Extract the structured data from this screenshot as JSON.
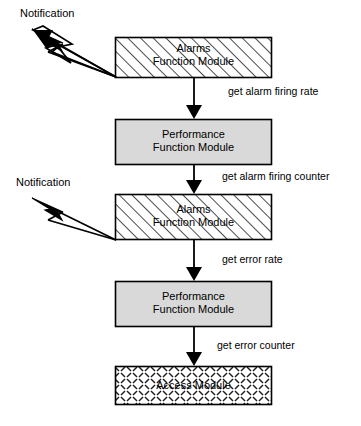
{
  "diagram": {
    "type": "flow-diagram",
    "background_color": "#ffffff",
    "stroke_color": "#000000",
    "fill_gray": "#d9d9d9",
    "nodes": [
      {
        "id": "alarms-1",
        "line1": "Alarms",
        "line2": "Function Module",
        "fill": "diagonal-hatch",
        "x": 115,
        "y": 37,
        "w": 157,
        "h": 41
      },
      {
        "id": "performance-1",
        "line1": "Performance",
        "line2": "Function Module",
        "fill": "solid-gray",
        "x": 115,
        "y": 119,
        "w": 157,
        "h": 46
      },
      {
        "id": "alarms-2",
        "line1": "Alarms",
        "line2": "Function Module",
        "fill": "diagonal-hatch",
        "x": 115,
        "y": 194,
        "w": 157,
        "h": 46
      },
      {
        "id": "performance-2",
        "line1": "Performance",
        "line2": "Function Module",
        "fill": "solid-gray",
        "x": 115,
        "y": 281,
        "w": 157,
        "h": 46
      },
      {
        "id": "access",
        "line1": "Access Module",
        "line2": "",
        "fill": "cross-dash-hatch",
        "x": 115,
        "y": 366,
        "w": 157,
        "h": 39
      }
    ],
    "edges": [
      {
        "id": "edge-1",
        "label": "get alarm firing rate",
        "from": "alarms-1",
        "to": "performance-1",
        "label_x": 228,
        "label_y": 85
      },
      {
        "id": "edge-2",
        "label": "get alarm firing counter",
        "from": "performance-1",
        "to": "alarms-2",
        "label_x": 222,
        "label_y": 170
      },
      {
        "id": "edge-3",
        "label": "get error rate",
        "from": "alarms-2",
        "to": "performance-2",
        "label_x": 222,
        "label_y": 253
      },
      {
        "id": "edge-4",
        "label": "get error counter",
        "from": "performance-2",
        "to": "access",
        "label_x": 217,
        "label_y": 339
      }
    ],
    "notifications": [
      {
        "id": "notification-1",
        "label": "Notification",
        "label_x": 20,
        "label_y": 7,
        "from": "alarms-1"
      },
      {
        "id": "notification-2",
        "label": "Notification",
        "label_x": 16,
        "label_y": 176,
        "from": "alarms-2"
      }
    ]
  }
}
